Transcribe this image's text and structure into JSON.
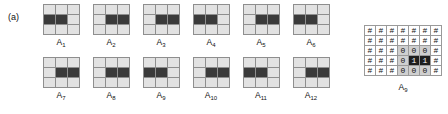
{
  "figure": {
    "panel_a": {
      "tag": "(a)",
      "patterns": [
        {
          "label": "A",
          "index": "1",
          "matrix": [
            [
              0,
              0,
              0
            ],
            [
              1,
              1,
              0
            ],
            [
              0,
              0,
              0
            ]
          ]
        },
        {
          "label": "A",
          "index": "2",
          "matrix": [
            [
              0,
              0,
              0
            ],
            [
              0,
              1,
              1
            ],
            [
              0,
              0,
              0
            ]
          ]
        },
        {
          "label": "A",
          "index": "3",
          "matrix": [
            [
              0,
              0,
              0
            ],
            [
              0,
              1,
              1
            ],
            [
              0,
              0,
              0
            ]
          ]
        },
        {
          "label": "A",
          "index": "4",
          "matrix": [
            [
              0,
              0,
              0
            ],
            [
              1,
              1,
              0
            ],
            [
              0,
              0,
              0
            ]
          ]
        },
        {
          "label": "A",
          "index": "5",
          "matrix": [
            [
              0,
              0,
              0
            ],
            [
              0,
              1,
              1
            ],
            [
              0,
              0,
              0
            ]
          ]
        },
        {
          "label": "A",
          "index": "6",
          "matrix": [
            [
              0,
              0,
              0
            ],
            [
              1,
              1,
              0
            ],
            [
              0,
              0,
              0
            ]
          ]
        },
        {
          "label": "A",
          "index": "7",
          "matrix": [
            [
              0,
              0,
              0
            ],
            [
              0,
              1,
              1
            ],
            [
              0,
              0,
              0
            ]
          ]
        },
        {
          "label": "A",
          "index": "8",
          "matrix": [
            [
              0,
              0,
              0
            ],
            [
              0,
              1,
              1
            ],
            [
              0,
              0,
              0
            ]
          ]
        },
        {
          "label": "A",
          "index": "9",
          "matrix": [
            [
              0,
              0,
              0
            ],
            [
              1,
              1,
              0
            ],
            [
              0,
              0,
              0
            ]
          ]
        },
        {
          "label": "A",
          "index": "10",
          "matrix": [
            [
              0,
              0,
              0
            ],
            [
              0,
              1,
              1
            ],
            [
              0,
              0,
              0
            ]
          ]
        },
        {
          "label": "A",
          "index": "11",
          "matrix": [
            [
              0,
              0,
              0
            ],
            [
              1,
              1,
              0
            ],
            [
              0,
              0,
              0
            ]
          ]
        },
        {
          "label": "A",
          "index": "12",
          "matrix": [
            [
              0,
              0,
              0
            ],
            [
              0,
              1,
              1
            ],
            [
              0,
              0,
              0
            ]
          ]
        }
      ]
    },
    "panel_b": {
      "tag": "b)",
      "label": "A",
      "label_index": "9",
      "char_grid": [
        [
          "#",
          "#",
          "#",
          "#",
          "#",
          "#",
          "#"
        ],
        [
          "#",
          "#",
          "#",
          "#",
          "#",
          "#",
          "#"
        ],
        [
          "#",
          "#",
          "#",
          "0",
          "0",
          "0",
          "#"
        ],
        [
          "#",
          "#",
          "#",
          "0",
          "1",
          "1",
          "#"
        ],
        [
          "#",
          "#",
          "#",
          "0",
          "0",
          "0",
          "#"
        ]
      ]
    },
    "colors": {
      "cell_off": "#e2e2e2",
      "cell_on": "#3a3a3a",
      "grid_line": "#8e8e8e",
      "char_zero_bg": "#cfcfcf",
      "char_one_bg": "#1e1e1e",
      "text": "#111111",
      "background": "#ffffff"
    }
  }
}
